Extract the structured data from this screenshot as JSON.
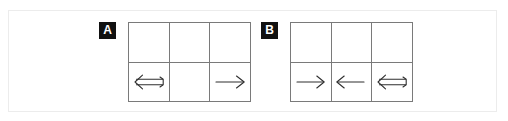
{
  "figure": {
    "background_color": "#ffffff",
    "frame_color": "#ececec",
    "grid_line_color": "#7a7a7a",
    "arrow_color": "#2f2f2f",
    "badge_background": "#111111",
    "badge_text_color": "#ffffff"
  },
  "panels": [
    {
      "label": "A",
      "badge_name": "panel-label-a",
      "grid": {
        "columns": 3,
        "rows": 2,
        "cells": [
          {
            "row": 1,
            "col": 1,
            "arrow": "none",
            "arrow_name": "empty-cell"
          },
          {
            "row": 1,
            "col": 2,
            "arrow": "none",
            "arrow_name": "empty-cell"
          },
          {
            "row": 1,
            "col": 3,
            "arrow": "none",
            "arrow_name": "empty-cell"
          },
          {
            "row": 2,
            "col": 1,
            "arrow": "double-left",
            "arrow_name": "double-left-arrow-icon"
          },
          {
            "row": 2,
            "col": 2,
            "arrow": "none",
            "arrow_name": "empty-cell"
          },
          {
            "row": 2,
            "col": 3,
            "arrow": "single-right",
            "arrow_name": "right-arrow-icon"
          }
        ]
      }
    },
    {
      "label": "B",
      "badge_name": "panel-label-b",
      "grid": {
        "columns": 3,
        "rows": 2,
        "cells": [
          {
            "row": 1,
            "col": 1,
            "arrow": "none",
            "arrow_name": "empty-cell"
          },
          {
            "row": 1,
            "col": 2,
            "arrow": "none",
            "arrow_name": "empty-cell"
          },
          {
            "row": 1,
            "col": 3,
            "arrow": "none",
            "arrow_name": "empty-cell"
          },
          {
            "row": 2,
            "col": 1,
            "arrow": "single-right",
            "arrow_name": "right-arrow-icon"
          },
          {
            "row": 2,
            "col": 2,
            "arrow": "single-left",
            "arrow_name": "left-arrow-icon"
          },
          {
            "row": 2,
            "col": 3,
            "arrow": "double-left",
            "arrow_name": "double-left-arrow-icon"
          }
        ]
      }
    }
  ]
}
